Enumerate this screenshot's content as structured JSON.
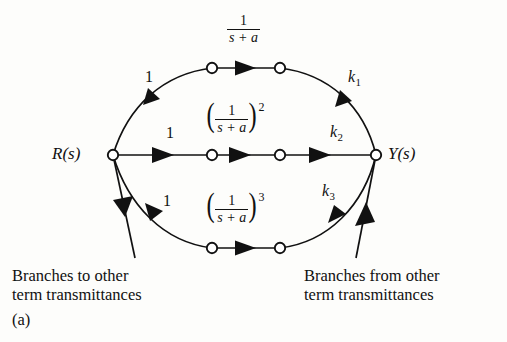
{
  "figure": {
    "id": "(a)",
    "type": "signal-flow-graph",
    "input_node": "R(s)",
    "output_node": "Y(s)",
    "captions": {
      "left_line1": "Branches to other",
      "left_line2": "term transmittances",
      "right_line1": "Branches from other",
      "right_line2": "term transmittances"
    },
    "branch_labels": {
      "top_input_gain": "1",
      "middle_input_gain": "1",
      "bottom_input_gain": "1",
      "top_output_gain_base": "k",
      "top_output_gain_sub": "1",
      "middle_output_gain_base": "k",
      "middle_output_gain_sub": "2",
      "bottom_output_gain_base": "k",
      "bottom_output_gain_sub": "3"
    },
    "transmittances": {
      "top": {
        "numerator": "1",
        "denominator": "s + a",
        "exponent": ""
      },
      "middle": {
        "numerator": "1",
        "denominator": "s + a",
        "exponent": "2"
      },
      "bottom": {
        "numerator": "1",
        "denominator": "s + a",
        "exponent": "3"
      }
    },
    "colors": {
      "ink": "#111111",
      "paper": "#fdfdfb"
    }
  }
}
